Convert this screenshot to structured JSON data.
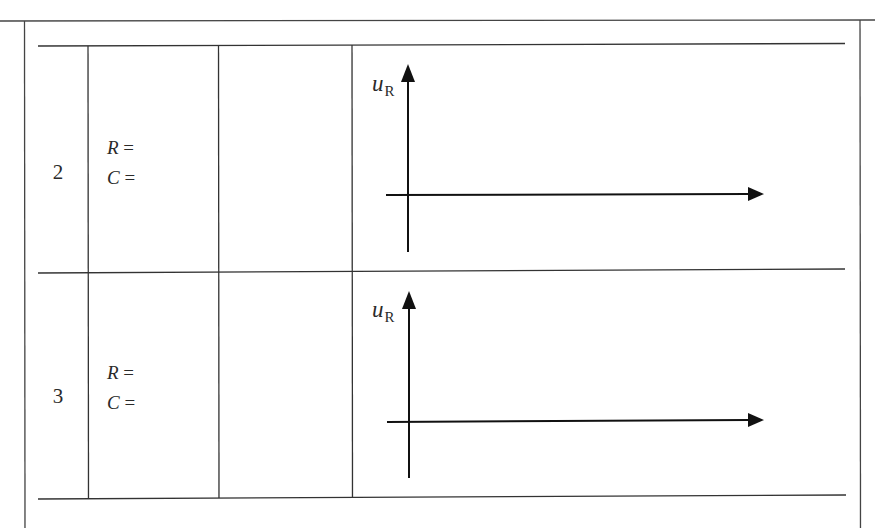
{
  "table": {
    "rows": [
      {
        "index": "2",
        "params": [
          {
            "var": "R",
            "eq": " ="
          },
          {
            "var": "C",
            "eq": " ="
          }
        ],
        "blank_cell": "",
        "graph": {
          "y_axis_label": "u",
          "y_axis_subscript": "R"
        }
      },
      {
        "index": "3",
        "params": [
          {
            "var": "R",
            "eq": " ="
          },
          {
            "var": "C",
            "eq": " ="
          }
        ],
        "blank_cell": "",
        "graph": {
          "y_axis_label": "u",
          "y_axis_subscript": "R"
        }
      }
    ]
  },
  "colors": {
    "line": "#3a3a3a",
    "arrow": "#111111",
    "background": "#ffffff"
  }
}
